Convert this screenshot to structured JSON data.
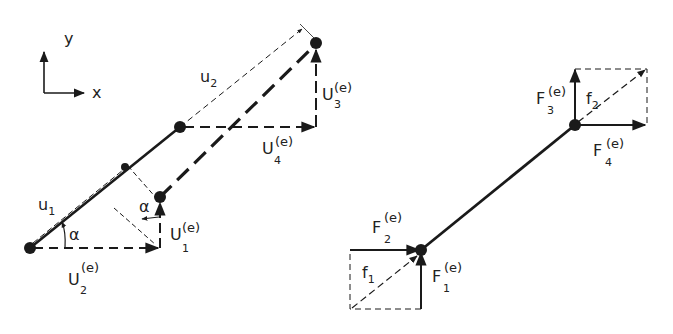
{
  "diagram": {
    "type": "finite-element bar element: nodal displacements and forces",
    "axes": {
      "x_label": "x",
      "y_label": "y"
    },
    "left_panel": {
      "title": "displacements",
      "labels": {
        "u1": {
          "base": "u",
          "sub": "1"
        },
        "u2": {
          "base": "u",
          "sub": "2"
        },
        "U1": {
          "base": "U",
          "sub": "1",
          "sup": "(e)"
        },
        "U2": {
          "base": "U",
          "sub": "2",
          "sup": "(e)"
        },
        "U3": {
          "base": "U",
          "sub": "3",
          "sup": "(e)"
        },
        "U4": {
          "base": "U",
          "sub": "4",
          "sup": "(e)"
        },
        "alpha1": "α",
        "alpha2": "α"
      }
    },
    "right_panel": {
      "title": "forces",
      "labels": {
        "f1": {
          "base": "f",
          "sub": "1"
        },
        "f2": {
          "base": "f",
          "sub": "2"
        },
        "F1": {
          "base": "F",
          "sub": "1",
          "sup": "(e)"
        },
        "F2": {
          "base": "F",
          "sub": "2",
          "sup": "(e)"
        },
        "F3": {
          "base": "F",
          "sub": "3",
          "sup": "(e)"
        },
        "F4": {
          "base": "F",
          "sub": "4",
          "sup": "(e)"
        }
      }
    },
    "colors": {
      "ink": "#1a1a1a",
      "background": "#ffffff"
    }
  }
}
